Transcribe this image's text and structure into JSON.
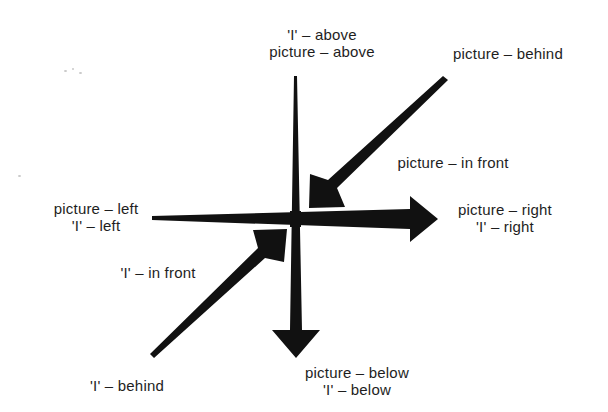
{
  "diagram": {
    "type": "spatial-relations-axes",
    "center": {
      "x": 295,
      "y": 219
    },
    "ink_color": "#111111",
    "labels": {
      "top": {
        "line1": "'I' – above",
        "line2": "picture – above"
      },
      "top_right": {
        "line1": "picture – behind"
      },
      "middle_right_diag": {
        "line1": "picture – in front"
      },
      "right": {
        "line1": "picture – right",
        "line2": "'I' – right"
      },
      "left": {
        "line1": "picture – left",
        "line2": "'I' – left"
      },
      "lower_left_diag": {
        "line1": "'I' – in front"
      },
      "bottom_left": {
        "line1": "'I' – behind"
      },
      "bottom": {
        "line1": "picture – below",
        "line2": "'I' – below"
      }
    },
    "arrows": [
      {
        "name": "vertical-axis-arrow",
        "from": "above",
        "to": "below",
        "tail": [
          295,
          76
        ],
        "tip": [
          296,
          358
        ]
      },
      {
        "name": "horizontal-axis-arrow",
        "from": "left",
        "to": "right",
        "tail": [
          152,
          218
        ],
        "tip": [
          438,
          219
        ]
      },
      {
        "name": "behind-to-front-diagonal-arrow",
        "from": "behind (upper right)",
        "to": "center",
        "tail": [
          446,
          78
        ],
        "tip": [
          308,
          208
        ]
      },
      {
        "name": "front-to-center-diagonal-arrow",
        "from": "behind (lower left)",
        "to": "center",
        "tail": [
          152,
          356
        ],
        "tip": [
          287,
          228
        ]
      }
    ]
  }
}
